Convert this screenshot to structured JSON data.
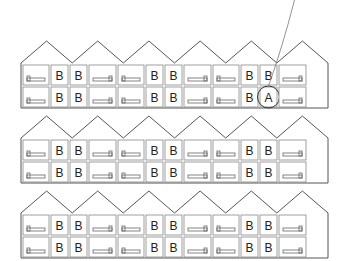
{
  "diagram": {
    "type": "terraced-housing-section",
    "buildings": [
      {
        "id": "building-1",
        "rows": [
          [
            "bed",
            "B",
            "B",
            "bed",
            "bed",
            "B",
            "B",
            "bed",
            "bed",
            "B",
            "B",
            "bed"
          ],
          [
            "bed",
            "B",
            "B",
            "bed",
            "bed",
            "B",
            "B",
            "bed",
            "bed",
            "B",
            "A",
            "bed"
          ]
        ]
      },
      {
        "id": "building-2",
        "rows": [
          [
            "bed",
            "B",
            "B",
            "bed",
            "bed",
            "B",
            "B",
            "bed",
            "bed",
            "B",
            "B",
            "bed"
          ],
          [
            "bed",
            "B",
            "B",
            "bed",
            "bed",
            "B",
            "B",
            "bed",
            "bed",
            "B",
            "B",
            "bed"
          ]
        ]
      },
      {
        "id": "building-3",
        "rows": [
          [
            "bed",
            "B",
            "B",
            "bed",
            "bed",
            "B",
            "B",
            "bed",
            "bed",
            "B",
            "B",
            "bed"
          ],
          [
            "bed",
            "B",
            "B",
            "bed",
            "bed",
            "B",
            "B",
            "bed",
            "bed",
            "B",
            "B",
            "bed"
          ]
        ]
      }
    ],
    "highlight": {
      "label": "A",
      "building": 0,
      "row": 1,
      "col": 10,
      "annotation": "circled with leader line"
    },
    "labels": {
      "bathroom": "B",
      "highlighted": "A"
    },
    "colors": {
      "line": "#555555",
      "background": "#ffffff"
    }
  }
}
